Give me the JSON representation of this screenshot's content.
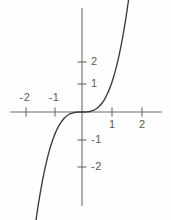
{
  "figure": {
    "background_color": "#fefefe",
    "axis_color": "#6b6b6b",
    "curve_color": "#3a3a3a",
    "label_color": "#5a5a5a"
  },
  "axes": {
    "x_axis_name": "x-axis",
    "y_axis_name": "y-axis",
    "origin_px": {
      "x": 82,
      "y": 112
    },
    "unit_px": 30,
    "x_axis_span_px": {
      "start": 10,
      "end": 162
    },
    "y_axis_span_px": {
      "start": 8,
      "end": 206
    }
  },
  "x_ticks": [
    {
      "value": -2,
      "label": "-2",
      "px": 26,
      "label_side": "above"
    },
    {
      "value": -1,
      "label": "-1",
      "px": 55,
      "label_side": "above"
    },
    {
      "value": 1,
      "label": "1",
      "px": 112,
      "label_side": "below"
    },
    {
      "value": 2,
      "label": "2",
      "px": 142,
      "label_side": "below"
    }
  ],
  "y_ticks": [
    {
      "value": 2,
      "label": "2",
      "px": 62,
      "label_side": "right"
    },
    {
      "value": 1,
      "label": "1",
      "px": 84,
      "label_side": "right"
    },
    {
      "value": -1,
      "label": "-1",
      "px": 140,
      "label_side": "right"
    },
    {
      "value": -2,
      "label": "-2",
      "px": 167,
      "label_side": "right"
    }
  ],
  "chart_data": {
    "type": "line",
    "title": "",
    "subtitle": "",
    "xlabel": "",
    "ylabel": "",
    "grid": false,
    "legend": null,
    "xlim": [
      -2.4,
      2.6
    ],
    "ylim": [
      -3.4,
      3.4
    ],
    "xticks": [
      -2,
      -1,
      1,
      2
    ],
    "yticks": [
      -2,
      -1,
      1,
      2
    ],
    "series": [
      {
        "name": "y = x^3",
        "equation": "y = x^3",
        "x": [
          -1.55,
          -1.5,
          -1.45,
          -1.4,
          -1.35,
          -1.3,
          -1.25,
          -1.2,
          -1.15,
          -1.1,
          -1.05,
          -1.0,
          -0.95,
          -0.9,
          -0.85,
          -0.8,
          -0.75,
          -0.7,
          -0.65,
          -0.6,
          -0.55,
          -0.5,
          -0.45,
          -0.4,
          -0.35,
          -0.3,
          -0.25,
          -0.2,
          -0.15,
          -0.1,
          -0.05,
          0.0,
          0.05,
          0.1,
          0.15,
          0.2,
          0.25,
          0.3,
          0.35,
          0.4,
          0.45,
          0.5,
          0.55,
          0.6,
          0.65,
          0.7,
          0.75,
          0.8,
          0.85,
          0.9,
          0.95,
          1.0,
          1.05,
          1.1,
          1.15,
          1.2,
          1.25,
          1.3,
          1.35,
          1.4,
          1.45,
          1.5,
          1.55
        ],
        "y": [
          -3.724,
          -3.375,
          -3.048,
          -2.744,
          -2.46,
          -2.197,
          -1.953,
          -1.728,
          -1.521,
          -1.331,
          -1.158,
          -1.0,
          -0.857,
          -0.729,
          -0.614,
          -0.512,
          -0.422,
          -0.343,
          -0.275,
          -0.216,
          -0.166,
          -0.125,
          -0.091,
          -0.064,
          -0.043,
          -0.027,
          -0.016,
          -0.008,
          -0.003,
          -0.001,
          0.0,
          0.0,
          0.0,
          0.001,
          0.003,
          0.008,
          0.016,
          0.027,
          0.043,
          0.064,
          0.091,
          0.125,
          0.166,
          0.216,
          0.275,
          0.343,
          0.422,
          0.512,
          0.614,
          0.729,
          0.857,
          1.0,
          1.158,
          1.331,
          1.521,
          1.728,
          1.953,
          2.197,
          2.46,
          2.744,
          3.048,
          3.375,
          3.724
        ]
      }
    ],
    "annotations": []
  }
}
